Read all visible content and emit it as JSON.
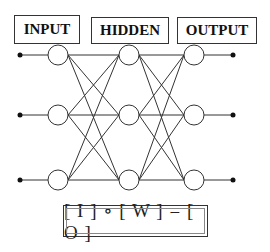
{
  "diagram": {
    "type": "neural-network",
    "layers": [
      {
        "label": "INPUT",
        "nodes": 3
      },
      {
        "label": "HIDDEN",
        "nodes": 3
      },
      {
        "label": "OUTPUT",
        "nodes": 3
      }
    ],
    "connections": "fully-connected between adjacent layers",
    "input_terminals": 3,
    "output_terminals": 3,
    "equation": "[ I ] ∘ [ W ] = [ O ]"
  },
  "colors": {
    "line": "#333333",
    "node_fill": "#ffffff",
    "background": "#ffffff"
  }
}
